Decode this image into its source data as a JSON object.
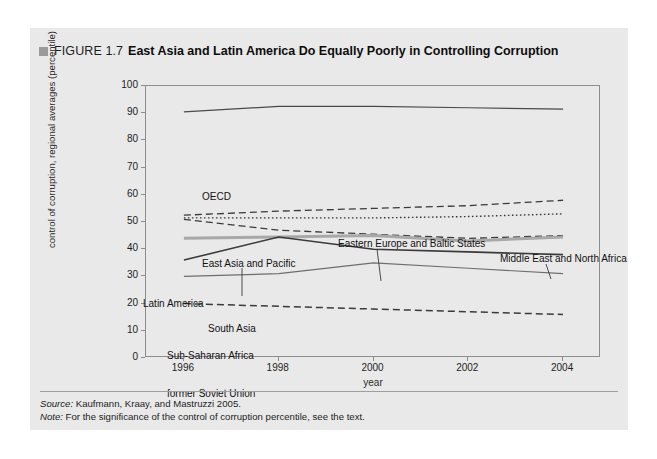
{
  "figure": {
    "marker": "square-marker",
    "number": "FIGURE 1.7",
    "title": "East Asia and Latin America Do Equally Poorly in Controlling Corruption"
  },
  "notes": {
    "source_keyword": "Source:",
    "source_text": " Kaufmann, Kraay, and Mastruzzi 2005.",
    "note_keyword": "Note:",
    "note_text": " For the significance of the control of corruption percentile, see the text."
  },
  "colors": {
    "panel_background": "#e9e9e9",
    "frame": "#8d8d8d",
    "dark_line": "#3a3a3a",
    "medium_line": "#6e6e6e",
    "thick_gray_line": "#a8a8a8",
    "text": "#1d1d1d"
  },
  "chart_data": {
    "type": "line",
    "title": "East Asia and Latin America Do Equally Poorly in Controlling Corruption",
    "xlabel": "year",
    "ylabel": "control of corruption, regional averages (percentile)",
    "x": [
      1996,
      1998,
      2000,
      2002,
      2004
    ],
    "xlim": [
      1995.2,
      2004.8
    ],
    "ylim": [
      0,
      100
    ],
    "ytick_labels": [
      "0",
      "10",
      "20",
      "30",
      "40",
      "50",
      "60",
      "70",
      "80",
      "90",
      "100"
    ],
    "ytick_values": [
      0,
      10,
      20,
      30,
      40,
      50,
      60,
      70,
      80,
      90,
      100
    ],
    "xtick_labels": [
      "1996",
      "1998",
      "2000",
      "2002",
      "2004"
    ],
    "grid": false,
    "legend": "inline-annotations",
    "series": [
      {
        "name": "OECD",
        "values": [
          90.5,
          92.5,
          92.5,
          92.0,
          91.5
        ],
        "style": "solid",
        "width": 1.2,
        "color": "#4a4a4a",
        "label_x": 172,
        "label_y": 118
      },
      {
        "name": "Middle East and North Africa",
        "values": [
          52.5,
          54.0,
          55.0,
          56.0,
          58.0
        ],
        "style": "dashed",
        "width": 1.3,
        "color": "#3a3a3a",
        "label_x": 470,
        "label_y": 180,
        "leader": {
          "x1": 516,
          "y1": 190,
          "x2": 521,
          "y2": 205
        }
      },
      {
        "name": "Eastern Europe and Baltic States",
        "values": [
          51.5,
          51.5,
          51.5,
          52.0,
          53.0
        ],
        "style": "dotted",
        "width": 1.4,
        "color": "#3a3a3a",
        "label_x": 308,
        "label_y": 165,
        "leader": {
          "x1": 347,
          "y1": 175,
          "x2": 351,
          "y2": 207
        }
      },
      {
        "name": "East Asia and Pacific",
        "values": [
          51.0,
          47.0,
          45.5,
          44.0,
          45.0
        ],
        "style": "dashed",
        "width": 1.3,
        "color": "#3a3a3a",
        "label_x": 172,
        "label_y": 185,
        "leader": {
          "x1": 212,
          "y1": 194,
          "x2": 212,
          "y2": 222
        }
      },
      {
        "name": "Latin America",
        "values": [
          44.0,
          44.5,
          45.0,
          43.0,
          44.5
        ],
        "style": "solid",
        "width": 3.0,
        "color": "#a8a8a8",
        "label_x": 113,
        "label_y": 225
      },
      {
        "name": "South Asia",
        "values": [
          36.0,
          44.5,
          40.0,
          39.0,
          38.0
        ],
        "style": "solid",
        "width": 1.6,
        "color": "#3a3a3a",
        "label_x": 178,
        "label_y": 250
      },
      {
        "name": "Sub-Saharan Africa",
        "values": [
          30.0,
          31.0,
          35.0,
          33.0,
          31.0
        ],
        "style": "solid",
        "width": 1.2,
        "color": "#6e6e6e",
        "label_x": 137,
        "label_y": 277
      },
      {
        "name": "former Soviet Union",
        "values": [
          20.0,
          19.0,
          18.0,
          17.0,
          16.0
        ],
        "style": "dashed",
        "width": 1.5,
        "color": "#3a3a3a",
        "label_x": 137,
        "label_y": 315
      }
    ]
  }
}
